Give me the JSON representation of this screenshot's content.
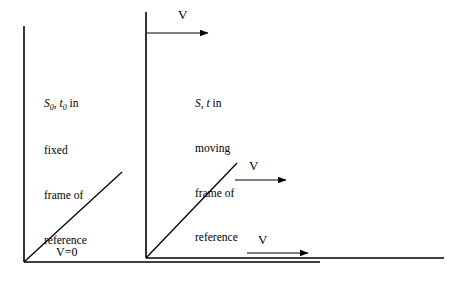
{
  "figure": {
    "title": "",
    "background_color": "#ffffff",
    "line_color": "#000000",
    "width": 461,
    "height": 284
  },
  "left_frame": {
    "caption_line1_symbols": "S",
    "caption_line1_sub1": "0",
    "caption_line1_comma": ", ",
    "caption_line1_symbol2": "t",
    "caption_line1_sub2": "0",
    "caption_line1_tail": " in",
    "caption_line2": "fixed",
    "caption_line3": "frame of",
    "caption_line4": "reference",
    "velocity_label": "V=0"
  },
  "right_frame": {
    "caption_line1_symbol1": "S",
    "caption_line1_comma": ", ",
    "caption_line1_symbol2": "t",
    "caption_line1_tail": " in",
    "caption_line2": "moving",
    "caption_line3": "frame of",
    "caption_line4": "reference",
    "velocity_label_top": "V",
    "velocity_label_middle": "V",
    "velocity_label_bottom": "V"
  },
  "geometry": {
    "left_axis_vertical": {
      "x": 24,
      "y_top": 26,
      "y_bottom": 262
    },
    "left_axis_horizontal": {
      "y": 262,
      "x_start": 24,
      "x_end": 320
    },
    "left_ray": {
      "x1": 24,
      "y1": 262,
      "x2": 122,
      "y2": 172
    },
    "right_axis_vertical": {
      "x": 146,
      "y_top": 12,
      "y_bottom": 258
    },
    "right_axis_horizontal": {
      "y": 258,
      "x_start": 146,
      "x_end": 444
    },
    "right_ray": {
      "x1": 146,
      "y1": 258,
      "x2": 237,
      "y2": 163
    },
    "arrow_top": {
      "x1": 147,
      "y1": 33,
      "x2": 210,
      "y2": 33
    },
    "arrow_middle": {
      "x1": 235,
      "y1": 180,
      "x2": 288,
      "y2": 180
    },
    "arrow_bottom": {
      "x1": 247,
      "y1": 253,
      "x2": 310,
      "y2": 253
    }
  }
}
